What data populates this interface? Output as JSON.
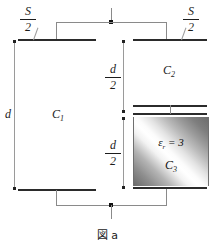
{
  "figure": {
    "caption": "図 a"
  },
  "labels": {
    "area_left": {
      "numerator": "S",
      "denominator": "2"
    },
    "area_right": {
      "numerator": "S",
      "denominator": "2"
    },
    "gap_total": "d",
    "gap_upper": {
      "numerator": "d",
      "denominator": "2"
    },
    "gap_lower": {
      "numerator": "d",
      "denominator": "2"
    },
    "c1": "C",
    "c1_sub": "1",
    "c2": "C",
    "c2_sub": "2",
    "c3": "C",
    "c3_sub": "3",
    "permittivity_symbol": "ε",
    "permittivity_sub": "r",
    "permittivity_value": "= 3"
  },
  "colors": {
    "plate": "#2b2b2b",
    "wire": "#8a8a8a",
    "node": "#111111",
    "dimension": "#9a9a9a",
    "text": "#1c1c1c",
    "background": "#ffffff"
  }
}
